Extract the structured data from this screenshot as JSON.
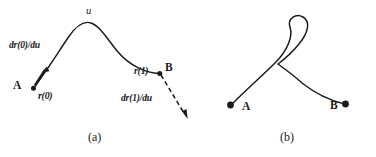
{
  "figure": {
    "background_color": "#ffffff",
    "ink_color": "#1a1a1a",
    "panels": [
      {
        "id": "a",
        "caption": "(a)",
        "description": "open arc curve from A to B with tangent vectors",
        "labels": {
          "parameter": "u",
          "start_point": "A",
          "end_point": "B",
          "start_vector": "r(0)",
          "end_vector": "r(1)",
          "start_derivative": "dr(0)/du",
          "end_derivative": "dr(1)/du"
        }
      },
      {
        "id": "b",
        "caption": "(b)",
        "description": "self-intersecting looped curve from A to B",
        "labels": {
          "start_point": "A",
          "end_point": "B"
        }
      }
    ]
  }
}
